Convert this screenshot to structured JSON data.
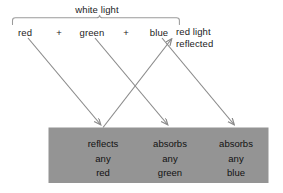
{
  "diagram": {
    "title_label": "white light",
    "brace": {
      "name": "white-light-brace"
    },
    "light_components": [
      {
        "id": "red",
        "label": "red",
        "x": 25
      },
      {
        "id": "green",
        "label": "green",
        "x": 92
      },
      {
        "id": "blue",
        "label": "blue",
        "x": 159
      }
    ],
    "operators": [
      {
        "label": "+",
        "x": 59
      },
      {
        "label": "+",
        "x": 126
      }
    ],
    "reflected_light": {
      "line1": "red light",
      "line2": "reflected"
    },
    "surface": {
      "fill_color": "#949494",
      "cells": [
        {
          "id": "red-cell",
          "x": 103,
          "lines": [
            "reflects",
            "any",
            "red"
          ]
        },
        {
          "id": "green-cell",
          "x": 170,
          "lines": [
            "absorbs",
            "any",
            "green"
          ]
        },
        {
          "id": "blue-cell",
          "x": 236,
          "lines": [
            "absorbs",
            "any",
            "blue"
          ]
        }
      ]
    },
    "arrows": [
      {
        "id": "incident-red",
        "from": "red",
        "to": "red-cell"
      },
      {
        "id": "incident-green",
        "from": "green",
        "to": "green-cell"
      },
      {
        "id": "incident-blue",
        "from": "blue",
        "to": "blue-cell"
      },
      {
        "id": "reflected-red",
        "from": "red-cell",
        "to": "reflected-light"
      }
    ],
    "stroke_color": "#8a8a8a",
    "text_color": "#1b1b1b"
  }
}
